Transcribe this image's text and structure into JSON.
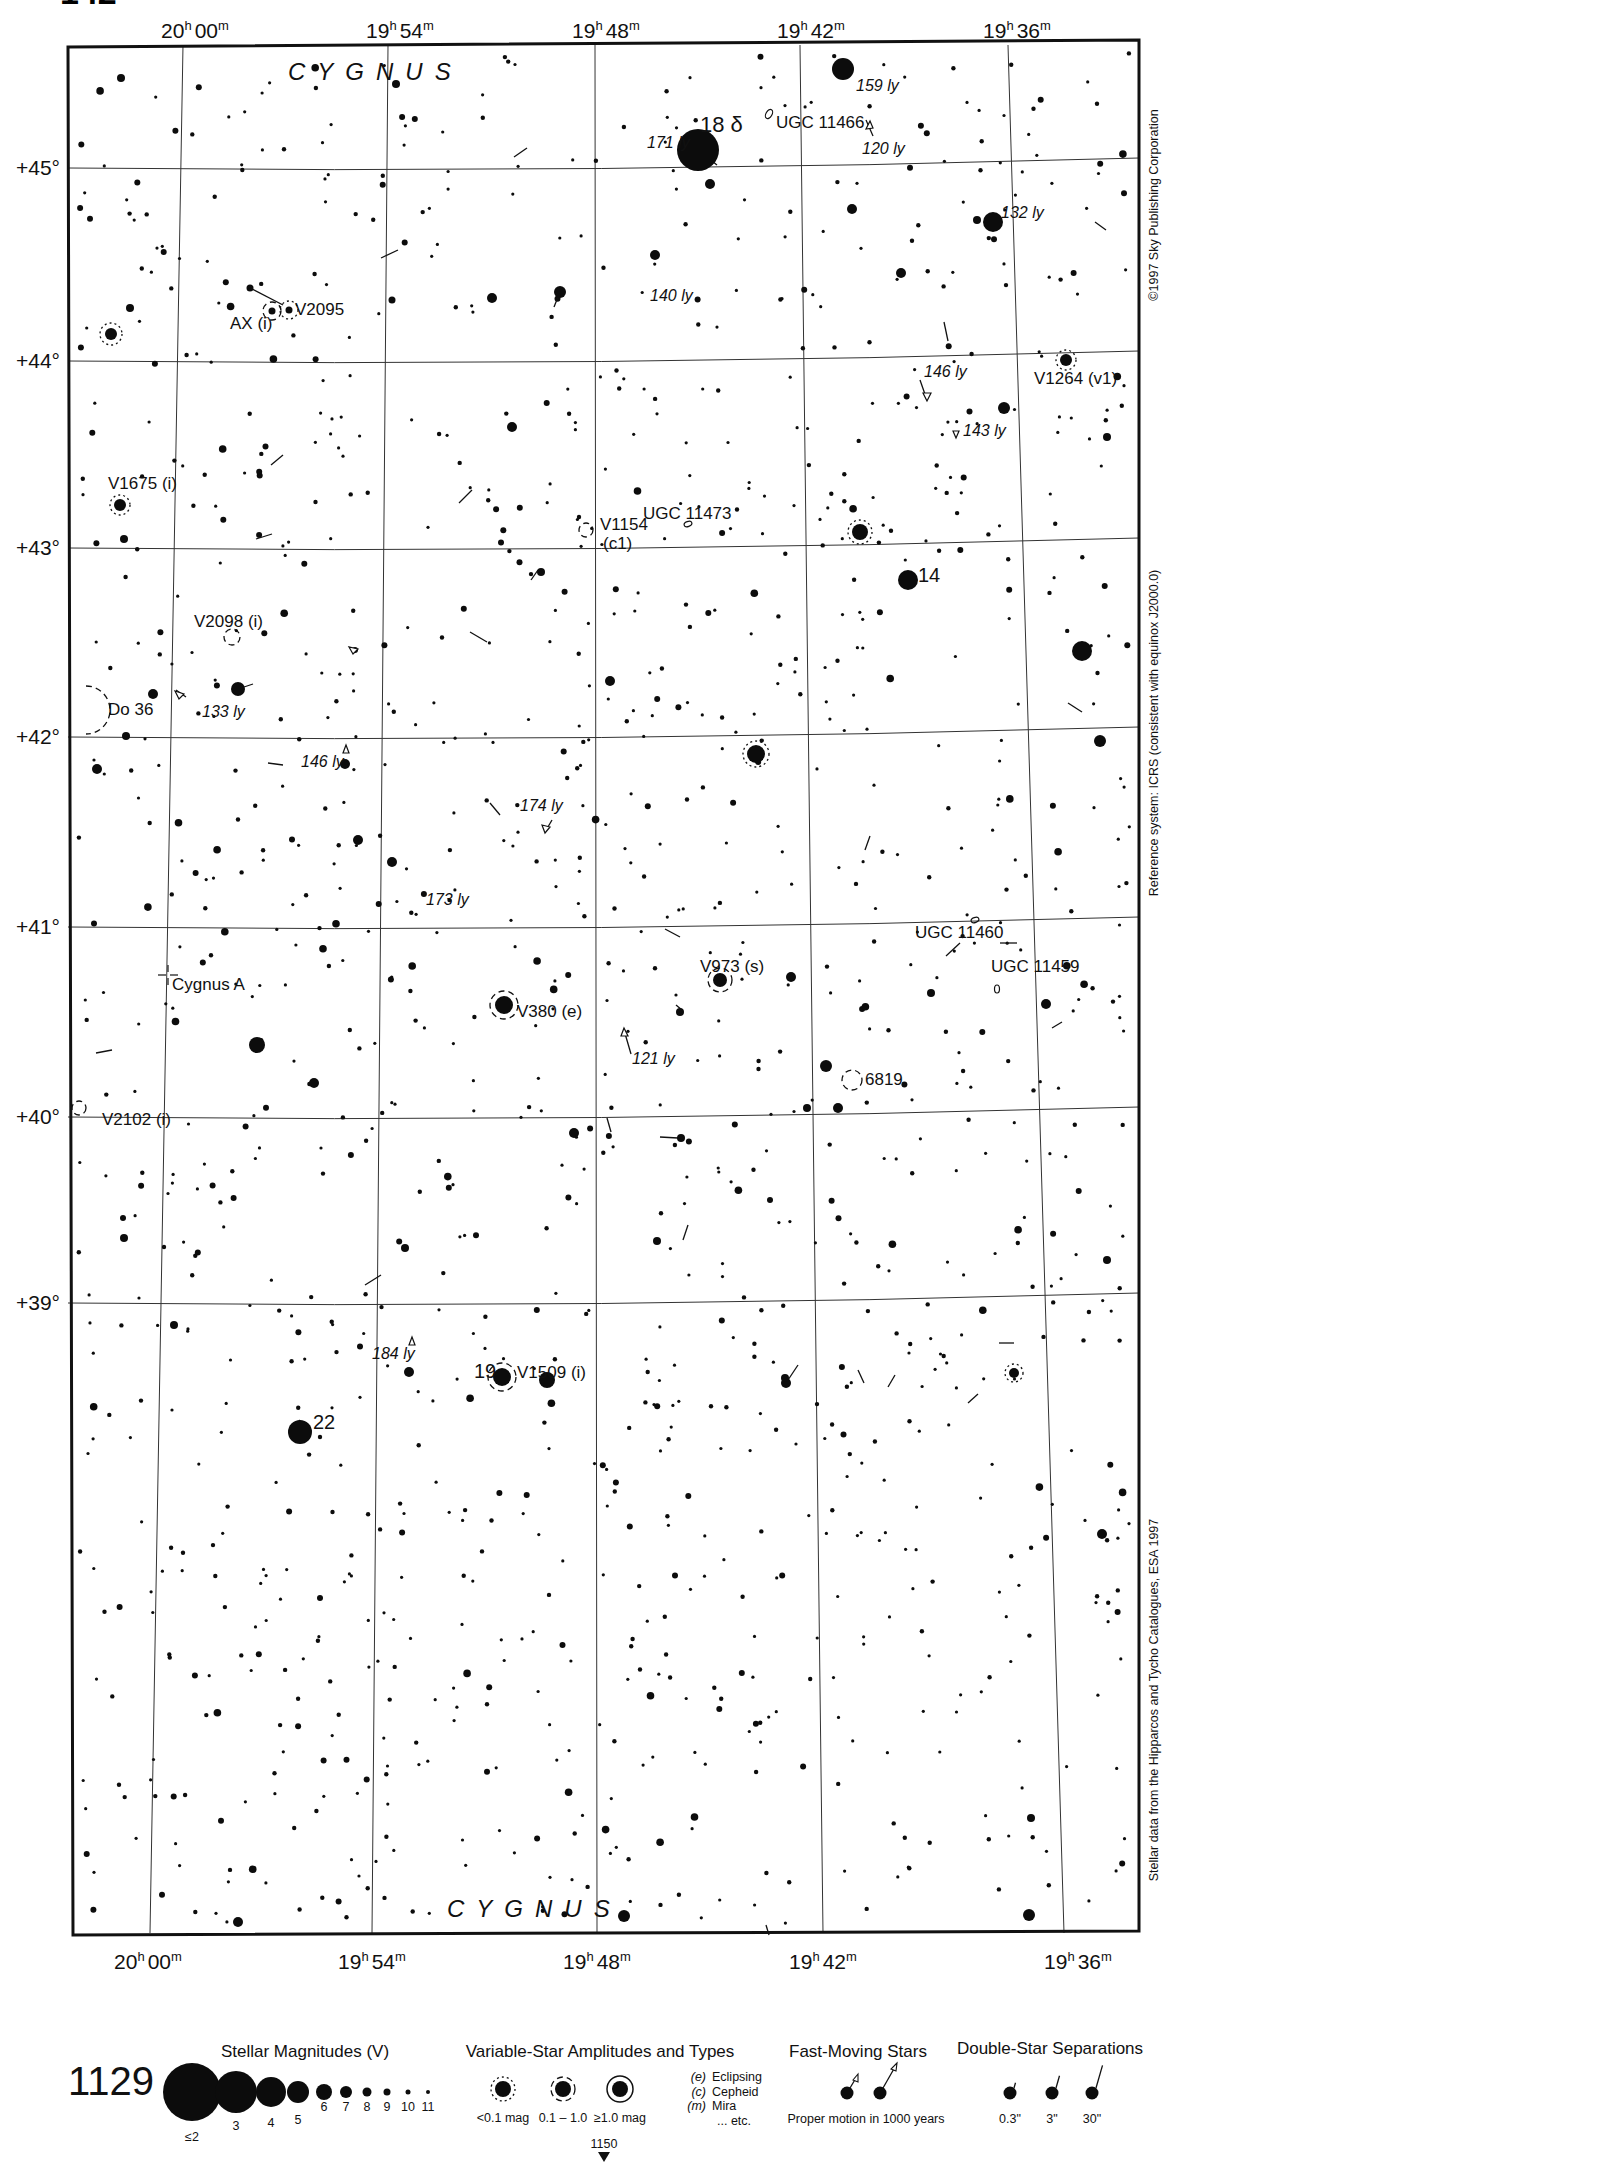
{
  "page": {
    "atlas_page_number": "1129",
    "next_page_below": "1150",
    "top_corner_partial": "142"
  },
  "chart_data": {
    "type": "star-map",
    "constellation": "CYGNUS",
    "ra_labels_top": [
      "20h 00m",
      "19h 54m",
      "19h 48m",
      "19h 42m",
      "19h 36m"
    ],
    "ra_labels_bottom": [
      "20h 00m",
      "19h 54m",
      "19h 48m",
      "19h 42m",
      "19h 36m"
    ],
    "dec_labels": [
      "+45°",
      "+44°",
      "+43°",
      "+42°",
      "+41°",
      "+40°",
      "+39°"
    ],
    "ra_range": [
      "20h 02m",
      "19h 33m"
    ],
    "dec_range": [
      38.4,
      45.6
    ]
  },
  "axes": {
    "top": [
      {
        "h": "20",
        "m": "00",
        "x": 195
      },
      {
        "h": "19",
        "m": "54",
        "x": 400
      },
      {
        "h": "19",
        "m": "48",
        "x": 606
      },
      {
        "h": "19",
        "m": "42",
        "x": 811
      },
      {
        "h": "19",
        "m": "36",
        "x": 1017
      }
    ],
    "bottom": [
      {
        "h": "20",
        "m": "00",
        "x": 148
      },
      {
        "h": "19",
        "m": "54",
        "x": 372
      },
      {
        "h": "19",
        "m": "48",
        "x": 597
      },
      {
        "h": "19",
        "m": "42",
        "x": 823
      },
      {
        "h": "19",
        "m": "36",
        "x": 1078
      }
    ],
    "dec": [
      {
        "label": "+45°",
        "y": 168
      },
      {
        "label": "+44°",
        "y": 361
      },
      {
        "label": "+43°",
        "y": 548
      },
      {
        "label": "+42°",
        "y": 737
      },
      {
        "label": "+41°",
        "y": 927
      },
      {
        "label": "+40°",
        "y": 1117
      },
      {
        "label": "+39°",
        "y": 1303
      }
    ]
  },
  "constellation_labels": [
    {
      "text": "CYGNUS",
      "x": 288,
      "y": 80
    },
    {
      "text": "CYGNUS",
      "x": 447,
      "y": 1917
    }
  ],
  "object_labels": [
    {
      "text": "18 δ",
      "x": 700,
      "y": 132,
      "size": 22
    },
    {
      "text": "UGC 11466",
      "x": 776,
      "y": 128
    },
    {
      "text": "V2095",
      "x": 295,
      "y": 315
    },
    {
      "text": "AX (i)",
      "x": 230,
      "y": 329
    },
    {
      "text": "V1264 (v1)",
      "x": 1034,
      "y": 384
    },
    {
      "text": "V1675 (i)",
      "x": 108,
      "y": 489
    },
    {
      "text": "V1154",
      "x": 600,
      "y": 530
    },
    {
      "text": "(c1)",
      "x": 603,
      "y": 549
    },
    {
      "text": "UGC 11473",
      "x": 643,
      "y": 519
    },
    {
      "text": "14",
      "x": 918,
      "y": 582,
      "size": 20
    },
    {
      "text": "V2098 (i)",
      "x": 194,
      "y": 627
    },
    {
      "text": "Do 36",
      "x": 108,
      "y": 715
    },
    {
      "text": "UGC 11460",
      "x": 915,
      "y": 938
    },
    {
      "text": "UGC 11459",
      "x": 991,
      "y": 972
    },
    {
      "text": "V973 (s)",
      "x": 700,
      "y": 972
    },
    {
      "text": "Cygnus A",
      "x": 172,
      "y": 990
    },
    {
      "text": "V380 (e)",
      "x": 517,
      "y": 1017
    },
    {
      "text": "6819",
      "x": 865,
      "y": 1085
    },
    {
      "text": "V2102 (i)",
      "x": 102,
      "y": 1125
    },
    {
      "text": "19",
      "x": 474,
      "y": 1378,
      "size": 20
    },
    {
      "text": "V1509 (i)",
      "x": 517,
      "y": 1378
    },
    {
      "text": "22",
      "x": 313,
      "y": 1429,
      "size": 20
    }
  ],
  "distance_labels": [
    {
      "text": "159 ly",
      "x": 856,
      "y": 91
    },
    {
      "text": "171 ly",
      "x": 647,
      "y": 148
    },
    {
      "text": "120 ly",
      "x": 862,
      "y": 154
    },
    {
      "text": "132 ly",
      "x": 1001,
      "y": 218
    },
    {
      "text": "140 ly",
      "x": 650,
      "y": 301
    },
    {
      "text": "146 ly",
      "x": 924,
      "y": 377
    },
    {
      "text": "143 ly",
      "x": 963,
      "y": 436
    },
    {
      "text": "133 ly",
      "x": 202,
      "y": 717
    },
    {
      "text": "146 ly",
      "x": 301,
      "y": 767
    },
    {
      "text": "174 ly",
      "x": 520,
      "y": 811
    },
    {
      "text": "173 ly",
      "x": 426,
      "y": 905
    },
    {
      "text": "121 ly",
      "x": 632,
      "y": 1064
    },
    {
      "text": "184 ly",
      "x": 372,
      "y": 1359
    }
  ],
  "side_texts": {
    "copyright": "©1997 Sky Publishing Corporation",
    "reference": "Reference system: ICRS (consistent with equinox J2000.0)",
    "source": "Stellar data from the Hipparcos and Tycho Catalogues, ESA 1997"
  },
  "legend": {
    "magnitudes": {
      "title": "Stellar Magnitudes (V)",
      "items": [
        {
          "label": "≤2",
          "r": 29
        },
        {
          "label": "3",
          "r": 21
        },
        {
          "label": "4",
          "r": 15
        },
        {
          "label": "5",
          "r": 11
        },
        {
          "label": "6",
          "r": 8
        },
        {
          "label": "7",
          "r": 6
        },
        {
          "label": "8",
          "r": 4.5
        },
        {
          "label": "9",
          "r": 3.5
        },
        {
          "label": "10",
          "r": 2.5
        },
        {
          "label": "11",
          "r": 2
        }
      ]
    },
    "variables": {
      "title": "Variable-Star Amplitudes and Types",
      "items": [
        {
          "label": "<0.1 mag",
          "style": "dotted"
        },
        {
          "label": "0.1 – 1.0",
          "style": "dashed"
        },
        {
          "label": "≥1.0 mag",
          "style": "solid"
        }
      ],
      "types": [
        {
          "code": "(e)",
          "name": "Eclipsing"
        },
        {
          "code": "(c)",
          "name": "Cepheid"
        },
        {
          "code": "(m)",
          "name": "Mira"
        },
        {
          "code": "",
          "name": "... etc."
        }
      ]
    },
    "fast_moving": {
      "title": "Fast-Moving Stars",
      "caption": "Proper motion in 1000 years"
    },
    "doubles": {
      "title": "Double-Star Separations",
      "items": [
        {
          "label": "0.3\"",
          "len": 6
        },
        {
          "label": "3\"",
          "len": 14
        },
        {
          "label": "30\"",
          "len": 26
        }
      ]
    }
  },
  "bright_stars": [
    {
      "x": 698,
      "y": 150,
      "r": 21
    },
    {
      "x": 843,
      "y": 69,
      "r": 11
    },
    {
      "x": 993,
      "y": 222,
      "r": 10
    },
    {
      "x": 300,
      "y": 1432,
      "r": 12
    },
    {
      "x": 908,
      "y": 580,
      "r": 10
    },
    {
      "x": 1082,
      "y": 651,
      "r": 10
    },
    {
      "x": 756,
      "y": 754,
      "r": 9
    },
    {
      "x": 860,
      "y": 532,
      "r": 8
    },
    {
      "x": 504,
      "y": 1005,
      "r": 9
    },
    {
      "x": 502,
      "y": 1377,
      "r": 9
    },
    {
      "x": 547,
      "y": 1380,
      "r": 8
    },
    {
      "x": 257,
      "y": 1045,
      "r": 8
    },
    {
      "x": 238,
      "y": 689,
      "r": 7
    },
    {
      "x": 720,
      "y": 980,
      "r": 7
    },
    {
      "x": 111,
      "y": 334,
      "r": 6
    },
    {
      "x": 1066,
      "y": 360,
      "r": 6
    },
    {
      "x": 120,
      "y": 505,
      "r": 6
    },
    {
      "x": 560,
      "y": 292,
      "r": 6
    },
    {
      "x": 710,
      "y": 184,
      "r": 5
    },
    {
      "x": 852,
      "y": 209,
      "r": 5
    },
    {
      "x": 1004,
      "y": 408,
      "r": 6
    },
    {
      "x": 512,
      "y": 427,
      "r": 5
    },
    {
      "x": 1100,
      "y": 741,
      "r": 6
    },
    {
      "x": 97,
      "y": 769,
      "r": 5
    },
    {
      "x": 358,
      "y": 840,
      "r": 5
    },
    {
      "x": 392,
      "y": 862,
      "r": 5
    },
    {
      "x": 791,
      "y": 977,
      "r": 5
    },
    {
      "x": 314,
      "y": 1083,
      "r": 5
    },
    {
      "x": 826,
      "y": 1066,
      "r": 6
    },
    {
      "x": 574,
      "y": 1133,
      "r": 5
    },
    {
      "x": 786,
      "y": 1383,
      "r": 5
    },
    {
      "x": 624,
      "y": 1916,
      "r": 6
    },
    {
      "x": 1029,
      "y": 1915,
      "r": 6
    },
    {
      "x": 238,
      "y": 1922,
      "r": 5
    },
    {
      "x": 1102,
      "y": 1534,
      "r": 5
    },
    {
      "x": 409,
      "y": 1372,
      "r": 5
    },
    {
      "x": 1014,
      "y": 1373,
      "r": 5
    },
    {
      "x": 153,
      "y": 694,
      "r": 5
    },
    {
      "x": 345,
      "y": 764,
      "r": 5
    },
    {
      "x": 655,
      "y": 255,
      "r": 5
    },
    {
      "x": 492,
      "y": 298,
      "r": 5
    },
    {
      "x": 121,
      "y": 78,
      "r": 4
    },
    {
      "x": 396,
      "y": 84,
      "r": 4
    },
    {
      "x": 1107,
      "y": 437,
      "r": 4
    },
    {
      "x": 901,
      "y": 273,
      "r": 5
    },
    {
      "x": 977,
      "y": 220,
      "r": 4
    },
    {
      "x": 610,
      "y": 681,
      "r": 5
    },
    {
      "x": 541,
      "y": 572,
      "r": 4
    },
    {
      "x": 1046,
      "y": 1004,
      "r": 5
    },
    {
      "x": 931,
      "y": 993,
      "r": 4
    },
    {
      "x": 680,
      "y": 1012,
      "r": 4
    },
    {
      "x": 838,
      "y": 1108,
      "r": 5
    },
    {
      "x": 807,
      "y": 1108,
      "r": 4
    },
    {
      "x": 681,
      "y": 1138,
      "r": 4
    },
    {
      "x": 657,
      "y": 1241,
      "r": 4
    },
    {
      "x": 124,
      "y": 1238,
      "r": 4
    },
    {
      "x": 123,
      "y": 1218,
      "r": 3
    },
    {
      "x": 405,
      "y": 1248,
      "r": 4
    },
    {
      "x": 1031,
      "y": 1818,
      "r": 4
    },
    {
      "x": 785,
      "y": 1378,
      "r": 4
    },
    {
      "x": 174,
      "y": 1325,
      "r": 4
    },
    {
      "x": 1107,
      "y": 1260,
      "r": 4
    },
    {
      "x": 392,
      "y": 300,
      "r": 3.5
    },
    {
      "x": 250,
      "y": 288,
      "r": 3.5
    },
    {
      "x": 289,
      "y": 310,
      "r": 3.5
    },
    {
      "x": 272,
      "y": 311,
      "r": 3.5
    },
    {
      "x": 130,
      "y": 308,
      "r": 4
    },
    {
      "x": 124,
      "y": 539,
      "r": 4
    },
    {
      "x": 126,
      "y": 736,
      "r": 4
    }
  ],
  "variable_marks": [
    {
      "x": 111,
      "y": 334,
      "r": 11,
      "style": "dotted"
    },
    {
      "x": 1066,
      "y": 360,
      "r": 10,
      "style": "dotted"
    },
    {
      "x": 120,
      "y": 505,
      "r": 10,
      "style": "dotted"
    },
    {
      "x": 860,
      "y": 532,
      "r": 12,
      "style": "dotted"
    },
    {
      "x": 756,
      "y": 754,
      "r": 13,
      "style": "dotted"
    },
    {
      "x": 272,
      "y": 311,
      "r": 9,
      "style": "dashed"
    },
    {
      "x": 289,
      "y": 310,
      "r": 9,
      "style": "dotted"
    },
    {
      "x": 232,
      "y": 637,
      "r": 8,
      "style": "dashed"
    },
    {
      "x": 586,
      "y": 530,
      "r": 7,
      "style": "dashed"
    },
    {
      "x": 504,
      "y": 1005,
      "r": 14,
      "style": "dashed"
    },
    {
      "x": 720,
      "y": 980,
      "r": 12,
      "style": "dashed"
    },
    {
      "x": 502,
      "y": 1377,
      "r": 14,
      "style": "dashed"
    },
    {
      "x": 1014,
      "y": 1373,
      "r": 9,
      "style": "dotted"
    },
    {
      "x": 79,
      "y": 1108,
      "r": 7,
      "style": "dashed"
    }
  ],
  "proper_motion_lines": [
    {
      "x1": 250,
      "y1": 288,
      "x2": 283,
      "y2": 305
    },
    {
      "x1": 698,
      "y1": 150,
      "x2": 717,
      "y2": 165
    },
    {
      "x1": 873,
      "y1": 136,
      "x2": 866,
      "y2": 120
    },
    {
      "x1": 527,
      "y1": 148,
      "x2": 514,
      "y2": 157
    },
    {
      "x1": 381,
      "y1": 258,
      "x2": 398,
      "y2": 250
    },
    {
      "x1": 560,
      "y1": 292,
      "x2": 554,
      "y2": 307
    },
    {
      "x1": 944,
      "y1": 322,
      "x2": 948,
      "y2": 341
    },
    {
      "x1": 920,
      "y1": 380,
      "x2": 927,
      "y2": 400
    },
    {
      "x1": 271,
      "y1": 465,
      "x2": 283,
      "y2": 455
    },
    {
      "x1": 459,
      "y1": 503,
      "x2": 472,
      "y2": 490
    },
    {
      "x1": 256,
      "y1": 539,
      "x2": 272,
      "y2": 534
    },
    {
      "x1": 531,
      "y1": 580,
      "x2": 538,
      "y2": 570
    },
    {
      "x1": 238,
      "y1": 689,
      "x2": 253,
      "y2": 684
    },
    {
      "x1": 470,
      "y1": 632,
      "x2": 487,
      "y2": 642
    },
    {
      "x1": 186,
      "y1": 697,
      "x2": 176,
      "y2": 690
    },
    {
      "x1": 1068,
      "y1": 703,
      "x2": 1082,
      "y2": 712
    },
    {
      "x1": 268,
      "y1": 763,
      "x2": 283,
      "y2": 765
    },
    {
      "x1": 490,
      "y1": 803,
      "x2": 500,
      "y2": 815
    },
    {
      "x1": 552,
      "y1": 820,
      "x2": 545,
      "y2": 832
    },
    {
      "x1": 870,
      "y1": 836,
      "x2": 865,
      "y2": 850
    },
    {
      "x1": 665,
      "y1": 929,
      "x2": 680,
      "y2": 937
    },
    {
      "x1": 1017,
      "y1": 943,
      "x2": 1000,
      "y2": 943
    },
    {
      "x1": 946,
      "y1": 956,
      "x2": 960,
      "y2": 943
    },
    {
      "x1": 96,
      "y1": 1053,
      "x2": 112,
      "y2": 1050
    },
    {
      "x1": 624,
      "y1": 1030,
      "x2": 631,
      "y2": 1054
    },
    {
      "x1": 676,
      "y1": 1005,
      "x2": 682,
      "y2": 1010
    },
    {
      "x1": 1052,
      "y1": 1028,
      "x2": 1062,
      "y2": 1022
    },
    {
      "x1": 607,
      "y1": 1118,
      "x2": 611,
      "y2": 1132
    },
    {
      "x1": 660,
      "y1": 1137,
      "x2": 678,
      "y2": 1138
    },
    {
      "x1": 683,
      "y1": 1240,
      "x2": 688,
      "y2": 1225
    },
    {
      "x1": 381,
      "y1": 1275,
      "x2": 365,
      "y2": 1285
    },
    {
      "x1": 300,
      "y1": 1420,
      "x2": 290,
      "y2": 1432
    },
    {
      "x1": 786,
      "y1": 1383,
      "x2": 798,
      "y2": 1365
    },
    {
      "x1": 858,
      "y1": 1370,
      "x2": 864,
      "y2": 1383
    },
    {
      "x1": 888,
      "y1": 1387,
      "x2": 895,
      "y2": 1375
    },
    {
      "x1": 999,
      "y1": 1343,
      "x2": 1014,
      "y2": 1343
    },
    {
      "x1": 968,
      "y1": 1403,
      "x2": 978,
      "y2": 1394
    },
    {
      "x1": 1095,
      "y1": 222,
      "x2": 1106,
      "y2": 230
    },
    {
      "x1": 766,
      "y1": 1925,
      "x2": 769,
      "y2": 1935
    }
  ],
  "background_star_seed": 1129,
  "background_star_count": 1250
}
